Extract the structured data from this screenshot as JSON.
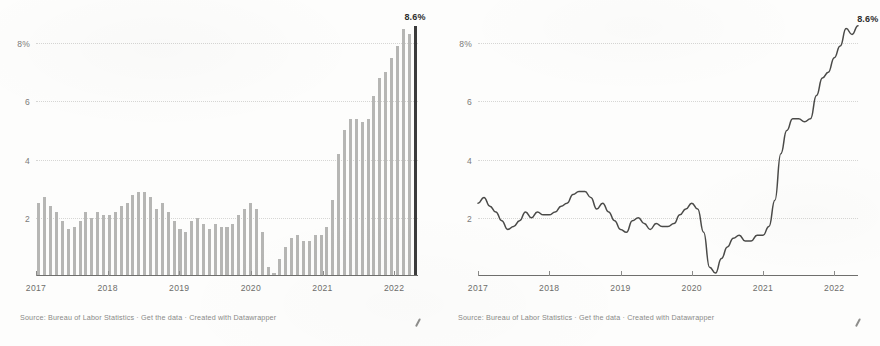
{
  "page": {
    "background": "#fdfdfc",
    "panels": [
      "bar-chart",
      "line-chart"
    ]
  },
  "charts": [
    {
      "id": "bar-chart",
      "footer": "Source: Bureau of Labor Statistics · Get the data · Created with Datawrapper",
      "value_label": "8.6%",
      "yticks": [
        "8%",
        "6",
        "4",
        "2"
      ],
      "xticks": [
        "2017",
        "2018",
        "2019",
        "2020",
        "2021",
        "2022"
      ],
      "colors": {
        "bar": "#b6b6b4",
        "highlight_bar": "#3b3b3b",
        "axis": "#6f6f6d",
        "grid": "#d6d6d4",
        "text": "#6d6d6b"
      }
    },
    {
      "id": "line-chart",
      "footer": "Source: Bureau of Labor Statistics · Get the data · Created with Datawrapper",
      "value_label": "8.6%",
      "yticks": [
        "8%",
        "6",
        "4",
        "2"
      ],
      "xticks": [
        "2017",
        "2018",
        "2019",
        "2020",
        "2021",
        "2022"
      ],
      "colors": {
        "line": "#4a4a48",
        "axis": "#6f6f6d",
        "grid": "#d6d6d4",
        "text": "#6d6d6b"
      }
    }
  ],
  "chart_data": [
    {
      "type": "bar",
      "title": "",
      "xlabel": "",
      "ylabel": "",
      "ylim": [
        0,
        9
      ],
      "yticks": [
        2,
        4,
        6,
        8
      ],
      "grid": true,
      "legend": "none",
      "annotations": [
        {
          "text": "8.6%",
          "at_index": 64,
          "value": 8.6
        }
      ],
      "highlight_index": 64,
      "x": [
        "2017-01",
        "2017-02",
        "2017-03",
        "2017-04",
        "2017-05",
        "2017-06",
        "2017-07",
        "2017-08",
        "2017-09",
        "2017-10",
        "2017-11",
        "2017-12",
        "2018-01",
        "2018-02",
        "2018-03",
        "2018-04",
        "2018-05",
        "2018-06",
        "2018-07",
        "2018-08",
        "2018-09",
        "2018-10",
        "2018-11",
        "2018-12",
        "2019-01",
        "2019-02",
        "2019-03",
        "2019-04",
        "2019-05",
        "2019-06",
        "2019-07",
        "2019-08",
        "2019-09",
        "2019-10",
        "2019-11",
        "2019-12",
        "2020-01",
        "2020-02",
        "2020-03",
        "2020-04",
        "2020-05",
        "2020-06",
        "2020-07",
        "2020-08",
        "2020-09",
        "2020-10",
        "2020-11",
        "2020-12",
        "2021-01",
        "2021-02",
        "2021-03",
        "2021-04",
        "2021-05",
        "2021-06",
        "2021-07",
        "2021-08",
        "2021-09",
        "2021-10",
        "2021-11",
        "2021-12",
        "2022-01",
        "2022-02",
        "2022-03",
        "2022-04",
        "2022-05"
      ],
      "values": [
        2.5,
        2.7,
        2.4,
        2.2,
        1.9,
        1.6,
        1.7,
        1.9,
        2.2,
        2.0,
        2.2,
        2.1,
        2.1,
        2.2,
        2.4,
        2.5,
        2.8,
        2.9,
        2.9,
        2.7,
        2.3,
        2.5,
        2.2,
        1.9,
        1.6,
        1.5,
        1.9,
        2.0,
        1.8,
        1.6,
        1.8,
        1.7,
        1.7,
        1.8,
        2.1,
        2.3,
        2.5,
        2.3,
        1.5,
        0.3,
        0.1,
        0.6,
        1.0,
        1.3,
        1.4,
        1.2,
        1.2,
        1.4,
        1.4,
        1.7,
        2.6,
        4.2,
        5.0,
        5.4,
        5.4,
        5.3,
        5.4,
        6.2,
        6.8,
        7.0,
        7.5,
        7.9,
        8.5,
        8.3,
        8.6
      ],
      "series_name": "CPI year-over-year change (%)"
    },
    {
      "type": "line",
      "title": "",
      "xlabel": "",
      "ylabel": "",
      "ylim": [
        0,
        9
      ],
      "yticks": [
        2,
        4,
        6,
        8
      ],
      "grid": true,
      "legend": "none",
      "annotations": [
        {
          "text": "8.6%",
          "at_index": 64,
          "value": 8.6
        }
      ],
      "x": [
        "2017-01",
        "2017-02",
        "2017-03",
        "2017-04",
        "2017-05",
        "2017-06",
        "2017-07",
        "2017-08",
        "2017-09",
        "2017-10",
        "2017-11",
        "2017-12",
        "2018-01",
        "2018-02",
        "2018-03",
        "2018-04",
        "2018-05",
        "2018-06",
        "2018-07",
        "2018-08",
        "2018-09",
        "2018-10",
        "2018-11",
        "2018-12",
        "2019-01",
        "2019-02",
        "2019-03",
        "2019-04",
        "2019-05",
        "2019-06",
        "2019-07",
        "2019-08",
        "2019-09",
        "2019-10",
        "2019-11",
        "2019-12",
        "2020-01",
        "2020-02",
        "2020-03",
        "2020-04",
        "2020-05",
        "2020-06",
        "2020-07",
        "2020-08",
        "2020-09",
        "2020-10",
        "2020-11",
        "2020-12",
        "2021-01",
        "2021-02",
        "2021-03",
        "2021-04",
        "2021-05",
        "2021-06",
        "2021-07",
        "2021-08",
        "2021-09",
        "2021-10",
        "2021-11",
        "2021-12",
        "2022-01",
        "2022-02",
        "2022-03",
        "2022-04",
        "2022-05"
      ],
      "values": [
        2.5,
        2.7,
        2.4,
        2.2,
        1.9,
        1.6,
        1.7,
        1.9,
        2.2,
        2.0,
        2.2,
        2.1,
        2.1,
        2.2,
        2.4,
        2.5,
        2.8,
        2.9,
        2.9,
        2.7,
        2.3,
        2.5,
        2.2,
        1.9,
        1.6,
        1.5,
        1.9,
        2.0,
        1.8,
        1.6,
        1.8,
        1.7,
        1.7,
        1.8,
        2.1,
        2.3,
        2.5,
        2.3,
        1.5,
        0.3,
        0.1,
        0.6,
        1.0,
        1.3,
        1.4,
        1.2,
        1.2,
        1.4,
        1.4,
        1.7,
        2.6,
        4.2,
        5.0,
        5.4,
        5.4,
        5.3,
        5.4,
        6.2,
        6.8,
        7.0,
        7.5,
        7.9,
        8.5,
        8.3,
        8.6
      ],
      "series_name": "CPI year-over-year change (%)"
    }
  ]
}
